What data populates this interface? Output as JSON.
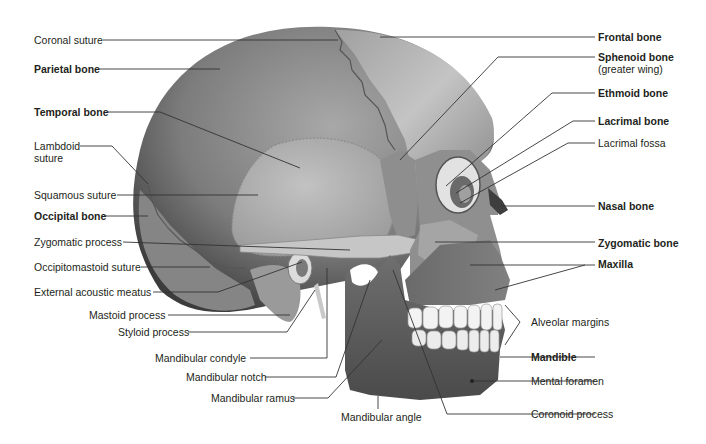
{
  "figure": {
    "colors": {
      "background": "#ffffff",
      "bone_dark": "#5e5e5e",
      "bone_mid": "#8a8a8a",
      "bone_light": "#b9b9b9",
      "teeth": "#f2f2f2",
      "leader_line": "#333333",
      "text": "#231f20"
    }
  },
  "labels_left": [
    {
      "text": "Coronal suture",
      "bold": false
    },
    {
      "text": "Parietal bone",
      "bold": true
    },
    {
      "text": "Temporal bone",
      "bold": true
    },
    {
      "text": "Lambdoid",
      "bold": false,
      "line2": "suture"
    },
    {
      "text": "Squamous suture",
      "bold": false
    },
    {
      "text": "Occipital bone",
      "bold": true
    },
    {
      "text": "Zygomatic process",
      "bold": false
    },
    {
      "text": "Occipitomastoid suture",
      "bold": false
    },
    {
      "text": "External acoustic meatus",
      "bold": false
    },
    {
      "text": "Mastoid process",
      "bold": false
    },
    {
      "text": "Styloid process",
      "bold": false
    },
    {
      "text": "Mandibular condyle",
      "bold": false
    },
    {
      "text": "Mandibular notch",
      "bold": false
    },
    {
      "text": "Mandibular ramus",
      "bold": false
    }
  ],
  "labels_bottom": [
    {
      "text": "Mandibular angle",
      "bold": false
    }
  ],
  "labels_right": [
    {
      "text": "Frontal bone",
      "bold": true
    },
    {
      "text": "Sphenoid bone",
      "bold": true,
      "line2": "(greater wing)"
    },
    {
      "text": "Ethmoid bone",
      "bold": true
    },
    {
      "text": "Lacrimal bone",
      "bold": true
    },
    {
      "text": "Lacrimal fossa",
      "bold": false
    },
    {
      "text": "Nasal bone",
      "bold": true
    },
    {
      "text": "Zygomatic bone",
      "bold": true
    },
    {
      "text": "Maxilla",
      "bold": true
    },
    {
      "text": "Alveolar margins",
      "bold": false
    },
    {
      "text": "Mandible",
      "bold": true
    },
    {
      "text": "Mental foramen",
      "bold": false
    },
    {
      "text": "Coronoid process",
      "bold": false
    }
  ]
}
